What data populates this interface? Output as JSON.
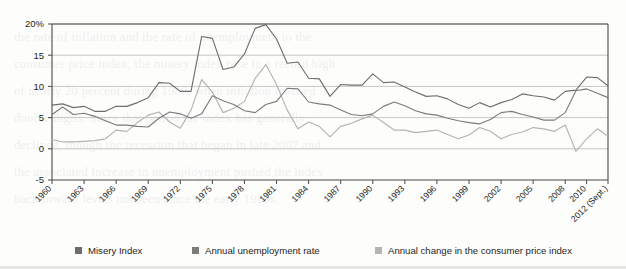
{
  "figure": {
    "background_color": "#fdfdfb",
    "plot_border_color": "#4a4a4a",
    "gridline_color": "#b9b9b9"
  },
  "legend": {
    "position": "bottom",
    "items": [
      {
        "label": "Misery Index",
        "color": "#6d6d6d",
        "swatch": "legend-swatch-misery"
      },
      {
        "label": "Annual unemployment rate",
        "color": "#7b7b7b",
        "swatch": "legend-swatch-unemployment"
      },
      {
        "label": "Annual change in the consumer price index",
        "color": "#b4b4b4",
        "swatch": "legend-swatch-cpi"
      }
    ]
  },
  "scan_artifacts": {
    "show_through_text": "the rate of inflation and the rate of unemployment to the\nconsumer price index, the misery index rose to a record high\nof nearly 20 percent during 1980, when inflation reached\ndouble digits. Since that period the index has generally\ndeclined, though the recession that began in late 2007 and\nthe associated increase in unemployment pushed the index\nback toward levels not seen since the early 1980s."
  },
  "chart_data": {
    "type": "line",
    "title": "",
    "subtitle": "",
    "xlabel": "",
    "ylabel": "",
    "ylim": [
      -5,
      20
    ],
    "yticks": [
      -5,
      0,
      5,
      10,
      15,
      20
    ],
    "ytick_labels": [
      "-5",
      "0",
      "5",
      "10",
      "15",
      "20%"
    ],
    "xlim": [
      1960,
      2012
    ],
    "xticks": [
      1960,
      1963,
      1966,
      1969,
      1972,
      1975,
      1978,
      1981,
      1984,
      1987,
      1990,
      1993,
      1996,
      1999,
      2002,
      2005,
      2008,
      2010,
      2012
    ],
    "xtick_labels": [
      "1960",
      "1963",
      "1966",
      "1969",
      "1972",
      "1975",
      "1978",
      "1981",
      "1984",
      "1987",
      "1990",
      "1993",
      "1996",
      "1999",
      "2002",
      "2005",
      "2008",
      "2010",
      "2012 (Sept.)"
    ],
    "xtick_rotation": -45,
    "grid": "horizontal",
    "legend_position": "bottom",
    "x": [
      1960,
      1961,
      1962,
      1963,
      1964,
      1965,
      1966,
      1967,
      1968,
      1969,
      1970,
      1971,
      1972,
      1973,
      1974,
      1975,
      1976,
      1977,
      1978,
      1979,
      1980,
      1981,
      1982,
      1983,
      1984,
      1985,
      1986,
      1987,
      1988,
      1989,
      1990,
      1991,
      1992,
      1993,
      1994,
      1995,
      1996,
      1997,
      1998,
      1999,
      2000,
      2001,
      2002,
      2003,
      2004,
      2005,
      2006,
      2007,
      2008,
      2009,
      2010,
      2011,
      2012
    ],
    "series": [
      {
        "name": "Misery Index",
        "color": "#6d6d6d",
        "values": [
          7.0,
          7.2,
          6.6,
          6.8,
          6.0,
          6.0,
          6.8,
          6.8,
          7.4,
          8.2,
          10.6,
          10.5,
          9.2,
          9.2,
          18.0,
          17.7,
          12.7,
          13.1,
          15.2,
          19.3,
          19.9,
          17.6,
          13.7,
          13.9,
          11.3,
          11.2,
          8.4,
          10.3,
          10.2,
          10.2,
          12.0,
          10.6,
          10.7,
          9.9,
          9.1,
          8.4,
          8.5,
          8.0,
          7.1,
          6.5,
          7.4,
          6.7,
          7.4,
          7.9,
          8.8,
          8.5,
          8.3,
          7.8,
          9.2,
          9.4,
          11.5,
          11.4,
          10.1
        ]
      },
      {
        "name": "Annual unemployment rate",
        "color": "#7b7b7b",
        "values": [
          5.5,
          6.7,
          5.5,
          5.7,
          5.2,
          4.5,
          3.8,
          3.8,
          3.6,
          3.5,
          4.9,
          5.9,
          5.6,
          4.9,
          5.6,
          8.5,
          7.7,
          7.1,
          6.1,
          5.8,
          7.1,
          7.6,
          9.7,
          9.6,
          7.5,
          7.2,
          7.0,
          6.2,
          5.5,
          5.3,
          5.6,
          6.8,
          7.5,
          6.9,
          6.1,
          5.6,
          5.4,
          4.9,
          4.5,
          4.2,
          4.0,
          4.7,
          5.8,
          6.0,
          5.5,
          5.1,
          4.6,
          4.6,
          5.8,
          9.3,
          9.6,
          8.9,
          8.2
        ]
      },
      {
        "name": "Annual change in the consumer price index",
        "color": "#b4b4b4",
        "values": [
          1.5,
          1.1,
          1.1,
          1.2,
          1.3,
          1.6,
          3.0,
          2.8,
          4.2,
          5.4,
          5.9,
          4.3,
          3.3,
          6.2,
          11.1,
          9.1,
          5.8,
          6.5,
          7.6,
          11.3,
          13.5,
          10.3,
          6.2,
          3.2,
          4.3,
          3.6,
          1.9,
          3.6,
          4.1,
          4.8,
          5.4,
          4.2,
          3.0,
          3.0,
          2.6,
          2.8,
          3.0,
          2.3,
          1.6,
          2.2,
          3.4,
          2.8,
          1.6,
          2.3,
          2.7,
          3.4,
          3.2,
          2.8,
          3.8,
          -0.4,
          1.6,
          3.2,
          2.0
        ]
      }
    ]
  }
}
